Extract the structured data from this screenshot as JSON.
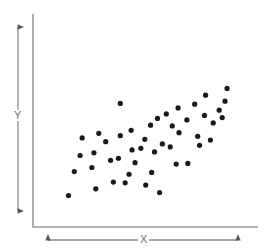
{
  "chart_data": {
    "type": "scatter",
    "title": "",
    "xlabel": "X",
    "ylabel": "Y",
    "grid": false,
    "legend": null,
    "axis_style": "arrowed-range-indicators",
    "xlim": [
      0,
      100
    ],
    "ylim": [
      0,
      100
    ],
    "tick_labels": {
      "x": [],
      "y": []
    },
    "series": [
      {
        "name": "observations",
        "color": "#1a1a1a",
        "marker": "circle",
        "marker_size": 4,
        "n_points": 47,
        "correlation": "positive",
        "points": [
          {
            "x": 14.7,
            "y": 13.6
          },
          {
            "x": 29.3,
            "y": 18.3
          },
          {
            "x": 17.8,
            "y": 30.4
          },
          {
            "x": 38.7,
            "y": 23.0
          },
          {
            "x": 27.2,
            "y": 33.2
          },
          {
            "x": 47.1,
            "y": 28.5
          },
          {
            "x": 45.0,
            "y": 22.5
          },
          {
            "x": 56.0,
            "y": 20.9
          },
          {
            "x": 63.4,
            "y": 15.7
          },
          {
            "x": 20.9,
            "y": 41.6
          },
          {
            "x": 28.3,
            "y": 43.5
          },
          {
            "x": 37.2,
            "y": 38.2
          },
          {
            "x": 41.4,
            "y": 39.7
          },
          {
            "x": 50.3,
            "y": 36.6
          },
          {
            "x": 34.6,
            "y": 51.3
          },
          {
            "x": 48.7,
            "y": 45.5
          },
          {
            "x": 60.7,
            "y": 44.1
          },
          {
            "x": 53.4,
            "y": 46.6
          },
          {
            "x": 72.3,
            "y": 35.6
          },
          {
            "x": 78.5,
            "y": 36.1
          },
          {
            "x": 22.0,
            "y": 53.9
          },
          {
            "x": 42.4,
            "y": 55.5
          },
          {
            "x": 55.5,
            "y": 52.9
          },
          {
            "x": 64.9,
            "y": 49.7
          },
          {
            "x": 69.1,
            "y": 47.6
          },
          {
            "x": 84.8,
            "y": 48.7
          },
          {
            "x": 48.2,
            "y": 59.2
          },
          {
            "x": 58.6,
            "y": 62.8
          },
          {
            "x": 73.8,
            "y": 57.6
          },
          {
            "x": 83.8,
            "y": 55.0
          },
          {
            "x": 90.6,
            "y": 52.4
          },
          {
            "x": 62.3,
            "y": 67.5
          },
          {
            "x": 70.2,
            "y": 62.3
          },
          {
            "x": 78.0,
            "y": 66.5
          },
          {
            "x": 92.1,
            "y": 64.4
          },
          {
            "x": 67.0,
            "y": 70.7
          },
          {
            "x": 87.4,
            "y": 69.6
          },
          {
            "x": 96.9,
            "y": 68.1
          },
          {
            "x": 42.4,
            "y": 78.0
          },
          {
            "x": 73.3,
            "y": 74.9
          },
          {
            "x": 82.2,
            "y": 77.5
          },
          {
            "x": 95.3,
            "y": 73.3
          },
          {
            "x": 98.4,
            "y": 79.6
          },
          {
            "x": 88.0,
            "y": 83.8
          },
          {
            "x": 99.5,
            "y": 88.5
          },
          {
            "x": 30.9,
            "y": 57.1
          },
          {
            "x": 59.2,
            "y": 29.8
          }
        ]
      }
    ]
  },
  "axes": {
    "y_arrow_name": "y-range-arrow",
    "x_arrow_name": "x-range-arrow",
    "line_color": "#9a9a9a",
    "label_color": "#6e6e6e"
  },
  "labels": {
    "y": "Y",
    "x": "X"
  }
}
